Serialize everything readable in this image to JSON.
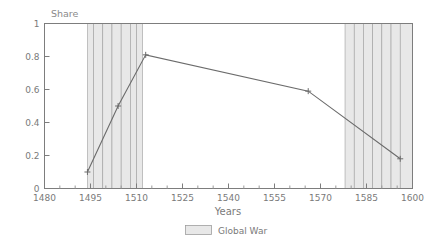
{
  "chart_data": {
    "type": "line",
    "title": "",
    "ylabel": "Share",
    "xlabel": "Years",
    "xlim": [
      1480,
      1600
    ],
    "ylim": [
      0,
      1
    ],
    "grid": false,
    "x_ticks": [
      1480,
      1495,
      1510,
      1525,
      1540,
      1555,
      1570,
      1585,
      1600
    ],
    "x_tick_labels": [
      "1480",
      "1495",
      "1510",
      "1525",
      "1540",
      "1555",
      "1570",
      "1585",
      "1600"
    ],
    "x_minor_ticks": [
      1485,
      1490,
      1500,
      1505,
      1515,
      1520,
      1530,
      1535,
      1545,
      1550,
      1560,
      1565,
      1575,
      1580,
      1590,
      1595
    ],
    "y_ticks": [
      0,
      0.2,
      0.4,
      0.6,
      0.8,
      1
    ],
    "y_tick_labels": [
      "0",
      "0.2",
      "0.4",
      "0.6",
      "0.8",
      "1"
    ],
    "series": [
      {
        "name": "Share",
        "marker": "plus",
        "x": [
          1494,
          1504,
          1513,
          1566,
          1596
        ],
        "y": [
          0.1,
          0.5,
          0.81,
          0.59,
          0.18
        ]
      }
    ],
    "shaded_bands": [
      {
        "label": "Global War",
        "start": 1494,
        "end": 1496
      },
      {
        "label": "Global War",
        "start": 1496,
        "end": 1499
      },
      {
        "label": "Global War",
        "start": 1499,
        "end": 1502
      },
      {
        "label": "Global War",
        "start": 1502,
        "end": 1505
      },
      {
        "label": "Global War",
        "start": 1505,
        "end": 1508
      },
      {
        "label": "Global War",
        "start": 1508,
        "end": 1510
      },
      {
        "label": "Global War",
        "start": 1510,
        "end": 1512
      },
      {
        "label": "Global War",
        "start": 1578,
        "end": 1581
      },
      {
        "label": "Global War",
        "start": 1581,
        "end": 1584
      },
      {
        "label": "Global War",
        "start": 1584,
        "end": 1587
      },
      {
        "label": "Global War",
        "start": 1587,
        "end": 1590
      },
      {
        "label": "Global War",
        "start": 1590,
        "end": 1593
      },
      {
        "label": "Global War",
        "start": 1593,
        "end": 1596
      },
      {
        "label": "Global War",
        "start": 1596,
        "end": 1600
      }
    ],
    "legend": {
      "position": "bottom-center",
      "entries": [
        {
          "label": "Global War",
          "swatch": "#e8e8e8"
        }
      ]
    },
    "colors": {
      "line": "#6b6b6b",
      "band": "#e8e8e8",
      "band_edge": "#9e9e9e",
      "axis": "#7d7d7d",
      "text": "#7a7a7a",
      "background": "#ffffff"
    }
  }
}
